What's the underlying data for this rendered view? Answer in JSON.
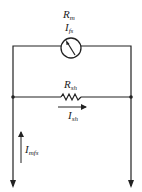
{
  "diagram": {
    "type": "circuit",
    "meter": {
      "resistance_label": {
        "main": "R",
        "sub": "m"
      },
      "current_label": {
        "main": "I",
        "sub": "fs"
      },
      "icon": "ammeter-needle-icon"
    },
    "shunt": {
      "resistance_label": {
        "main": "R",
        "sub": "sh"
      },
      "current_label": {
        "main": "I",
        "sub": "sh"
      },
      "icon": "resistor-zigzag-icon"
    },
    "total_current": {
      "label": {
        "main": "I",
        "sub": "mfs"
      },
      "direction": "up"
    },
    "colors": {
      "line": "#222222",
      "background": "#ffffff"
    }
  }
}
